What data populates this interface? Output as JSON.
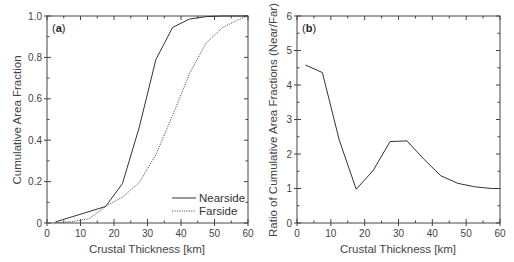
{
  "chart_data": [
    {
      "type": "line",
      "panel_label": "(a)",
      "panel_letter": "a",
      "title": "",
      "xlabel": "Crustal Thickness [km]",
      "ylabel": "Cumulative Area Fraction",
      "xlim": [
        0,
        60
      ],
      "ylim": [
        0,
        1.0
      ],
      "xticks": [
        0,
        10,
        20,
        30,
        40,
        50,
        60
      ],
      "xtick_labels": [
        "0",
        "10",
        "20",
        "30",
        "40",
        "50",
        "60"
      ],
      "yticks": [
        0,
        0.2,
        0.4,
        0.6,
        0.8,
        1.0
      ],
      "ytick_labels": [
        "0",
        "0.2",
        "0.4",
        "0.6",
        "0.8",
        "1.0"
      ],
      "grid": false,
      "legend_position": "lower right",
      "series": [
        {
          "name": "Nearside",
          "style": "solid",
          "x": [
            2.5,
            7.5,
            12.5,
            17.5,
            22.5,
            27.5,
            32.5,
            37.5,
            42.5,
            47.5,
            52.5,
            57.5,
            60
          ],
          "values": [
            0.005,
            0.03,
            0.055,
            0.08,
            0.19,
            0.46,
            0.79,
            0.945,
            0.985,
            0.997,
            1.0,
            1.0,
            1.0
          ]
        },
        {
          "name": "Farside",
          "style": "dotted",
          "x": [
            2.5,
            7.5,
            12.5,
            17.5,
            22.5,
            27.5,
            32.5,
            37.5,
            42.5,
            47.5,
            52.5,
            57.5,
            60
          ],
          "values": [
            0.001,
            0.007,
            0.02,
            0.08,
            0.125,
            0.195,
            0.33,
            0.52,
            0.72,
            0.87,
            0.945,
            0.985,
            1.0
          ]
        }
      ]
    },
    {
      "type": "line",
      "panel_label": "(b)",
      "panel_letter": "b",
      "title": "",
      "xlabel": "Crustal Thickness [km]",
      "ylabel": "Ratio of Cumulative Area Fractions (Near/Far)",
      "xlim": [
        0,
        60
      ],
      "ylim": [
        0,
        6
      ],
      "xticks": [
        0,
        10,
        20,
        30,
        40,
        50,
        60
      ],
      "xtick_labels": [
        "0",
        "10",
        "20",
        "30",
        "40",
        "50",
        "60"
      ],
      "yticks": [
        0,
        1,
        2,
        3,
        4,
        5,
        6
      ],
      "ytick_labels": [
        "0",
        "1",
        "2",
        "3",
        "4",
        "5",
        "6"
      ],
      "grid": false,
      "series": [
        {
          "name": "Near/Far ratio",
          "style": "solid",
          "x": [
            2.5,
            7.5,
            12.5,
            17.5,
            22.5,
            27.5,
            32.5,
            37.5,
            42.5,
            47.5,
            52.5,
            57.5,
            60
          ],
          "values": [
            4.58,
            4.36,
            2.4,
            0.98,
            1.52,
            2.36,
            2.38,
            1.85,
            1.37,
            1.15,
            1.05,
            1.0,
            1.0
          ]
        }
      ]
    }
  ]
}
